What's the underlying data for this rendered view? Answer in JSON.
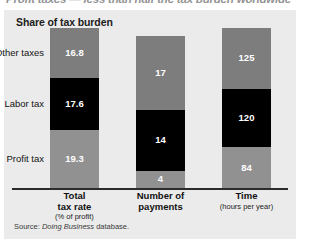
{
  "headline": "Profit taxes — less than half the tax burden worldwide",
  "panel": {
    "title": "Share of tax burden",
    "source_prefix": "Source:",
    "source_italic": "Doing Business",
    "source_suffix": "database."
  },
  "categories": [
    {
      "key": "other",
      "label": "Other taxes"
    },
    {
      "key": "labor",
      "label": "Labor tax"
    },
    {
      "key": "profit",
      "label": "Profit tax"
    }
  ],
  "groups": [
    {
      "key": "total-tax-rate",
      "main_line1": "Total",
      "main_line2": "tax rate",
      "sub": "(% of profit)",
      "values": {
        "other": "16.8",
        "labor": "17.6",
        "profit": "19.3"
      }
    },
    {
      "key": "number-of-payments",
      "main_line1": "Number of",
      "main_line2": "payments",
      "sub": "",
      "values": {
        "other": "17",
        "labor": "14",
        "profit": "4"
      }
    },
    {
      "key": "time",
      "main_line1": "Time",
      "main_line2": "",
      "sub": "(hours per year)",
      "values": {
        "other": "125",
        "labor": "120",
        "profit": "84"
      }
    }
  ],
  "chart_data": {
    "type": "bar",
    "title": "Share of tax burden",
    "subtitle": "Profit taxes — less than half the tax burden worldwide",
    "xlabel": "",
    "ylabel": "",
    "stacked": true,
    "normalized": true,
    "grid": false,
    "legend_position": "left-axis-labels",
    "categories": [
      "Total tax rate (% of profit)",
      "Number of payments",
      "Time (hours per year)"
    ],
    "series": [
      {
        "name": "Other taxes",
        "values": [
          16.8,
          17,
          125
        ],
        "color": "#7d7d7d"
      },
      {
        "name": "Labor tax",
        "values": [
          17.6,
          14,
          120
        ],
        "color": "#000000"
      },
      {
        "name": "Profit tax",
        "values": [
          19.3,
          4,
          84
        ],
        "color": "#919191"
      }
    ],
    "annotations": [
      "Source: Doing Business database."
    ]
  }
}
